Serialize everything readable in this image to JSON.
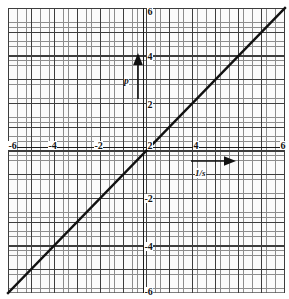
{
  "figure": {
    "kind": "cartesian-graph-paper-plot",
    "background_color": "#ffffff",
    "grid_color_minor": "#8d8d8d",
    "grid_color_major": "#3d3d3d",
    "axis_color": "#1a1a1a",
    "line_color": "#111111"
  },
  "axes": {
    "x_tick_labels": [
      "-6",
      "-4",
      "-2",
      "2",
      "4",
      "6"
    ],
    "y_tick_labels": [
      "6",
      "4",
      "2",
      "-2",
      "-4",
      "-6"
    ]
  },
  "annotations": {
    "vertical_arrow_label": "p",
    "horizontal_arrow_label": "1/s"
  },
  "chart_data": {
    "type": "line",
    "title": "",
    "xlabel": "",
    "ylabel": "",
    "xlim": [
      -6,
      6
    ],
    "ylim": [
      -6,
      6
    ],
    "grid": true,
    "minor_grid": true,
    "legend": "none",
    "x_ticks": [
      -6,
      -4,
      -2,
      2,
      4,
      6
    ],
    "y_ticks": [
      6,
      4,
      2,
      -2,
      -4,
      -6
    ],
    "x_tick_labels": [
      "-6",
      "-4",
      "-2",
      "2",
      "4",
      "6"
    ],
    "y_tick_labels": [
      "6",
      "4",
      "2",
      "-2",
      "-4",
      "-6"
    ],
    "series": [
      {
        "name": "y = x",
        "x": [
          -6,
          6
        ],
        "values": [
          -6,
          6
        ],
        "slope": 1,
        "intercept": 0,
        "color": "#111111",
        "width": 2.4
      }
    ],
    "annotations": [
      {
        "name": "p-axis-arrow",
        "text": "p",
        "direction": "up",
        "x": -0.05,
        "y_start": 2.1,
        "y_end": 3.8
      },
      {
        "name": "one-over-s-axis-arrow",
        "text": "1/s",
        "direction": "right",
        "y": -0.85,
        "x_start": 2.45,
        "x_end": 4.2
      }
    ]
  }
}
